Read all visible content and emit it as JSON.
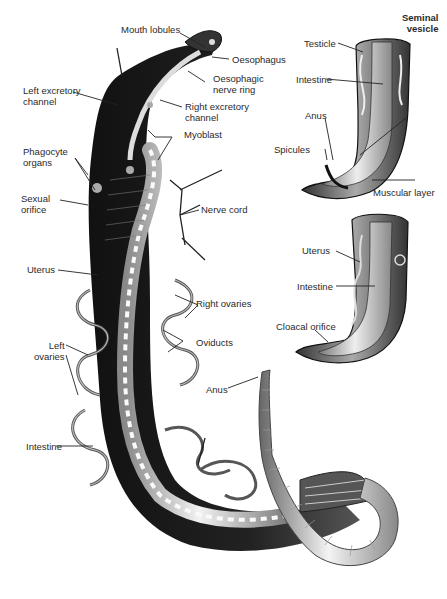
{
  "figure": {
    "main_view_labels": [
      {
        "id": "mouth-lobules",
        "text": "Mouth lobules"
      },
      {
        "id": "oesophagus",
        "text": "Oesophagus"
      },
      {
        "id": "oesophagic-nerve-ring",
        "text": "Oesophagic\nnerve ring",
        "lines": [
          "Oesophagic",
          "nerve ring"
        ]
      },
      {
        "id": "left-excretory-channel",
        "lines": [
          "Left excretory",
          "channel"
        ]
      },
      {
        "id": "right-excretory-channel",
        "lines": [
          "Right excretory",
          "channel"
        ]
      },
      {
        "id": "myoblast",
        "text": "Myoblast"
      },
      {
        "id": "phagocyte-organs",
        "lines": [
          "Phagocyte",
          "organs"
        ]
      },
      {
        "id": "sexual-orifice",
        "lines": [
          "Sexual",
          "orifice"
        ]
      },
      {
        "id": "nerve-cord",
        "text": "Nerve cord"
      },
      {
        "id": "uterus",
        "text": "Uterus"
      },
      {
        "id": "right-ovaries",
        "text": "Right ovaries"
      },
      {
        "id": "oviducts",
        "text": "Oviducts"
      },
      {
        "id": "left-ovaries",
        "lines": [
          "Left",
          "ovaries"
        ]
      },
      {
        "id": "anus",
        "text": "Anus"
      },
      {
        "id": "intestine",
        "text": "Intestine"
      }
    ],
    "male_tail_inset": {
      "title_lines": [
        "Seminal",
        "vesicle"
      ],
      "labels": [
        {
          "id": "testicle",
          "text": "Testicle"
        },
        {
          "id": "intestine",
          "text": "Intestine"
        },
        {
          "id": "anus",
          "text": "Anus"
        },
        {
          "id": "spicules",
          "text": "Spicules"
        },
        {
          "id": "muscular-layer",
          "text": "Muscular layer"
        }
      ]
    },
    "female_tail_inset": {
      "labels": [
        {
          "id": "uterus",
          "text": "Uterus"
        },
        {
          "id": "intestine",
          "text": "Intestine"
        },
        {
          "id": "cloacal-orifice",
          "text": "Cloacal orifice"
        }
      ]
    }
  }
}
